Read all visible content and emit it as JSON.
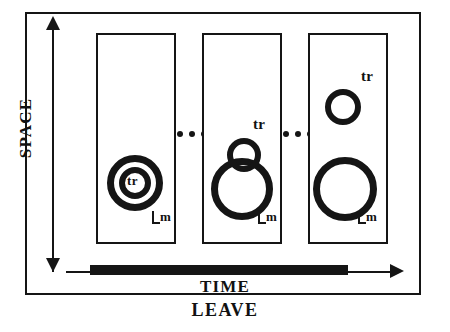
{
  "figure": {
    "caption": "LEAVE",
    "axes": {
      "y_label": "SPACE",
      "x_label": "TIME"
    },
    "panels": [
      {
        "id": "panel-1",
        "stage": 1,
        "shapes": [
          {
            "name": "outer-ring",
            "kind": "circle",
            "cx": 135,
            "cy": 183,
            "r": 28
          },
          {
            "name": "inner-ring",
            "kind": "circle",
            "cx": 135,
            "cy": 183,
            "r": 16
          }
        ],
        "labels": {
          "tr": "tr",
          "m": "m"
        }
      },
      {
        "id": "panel-2",
        "stage": 2,
        "shapes": [
          {
            "name": "large-ring",
            "kind": "circle",
            "cx": 242,
            "cy": 189,
            "r": 31
          },
          {
            "name": "small-ring",
            "kind": "circle",
            "cx": 244,
            "cy": 155,
            "r": 17
          }
        ],
        "labels": {
          "tr": "tr",
          "m": "m"
        }
      },
      {
        "id": "panel-3",
        "stage": 3,
        "shapes": [
          {
            "name": "large-ring",
            "kind": "circle",
            "cx": 345,
            "cy": 189,
            "r": 32
          },
          {
            "name": "small-ring",
            "kind": "circle",
            "cx": 343,
            "cy": 107,
            "r": 18
          }
        ],
        "labels": {
          "tr": "tr",
          "m": "m"
        }
      }
    ],
    "ellipses": [
      {
        "name": "ellipsis-1",
        "text": "..."
      },
      {
        "name": "ellipsis-2",
        "text": "..."
      }
    ],
    "colors": {
      "ink": "#151515",
      "paper": "#ffffff"
    }
  }
}
